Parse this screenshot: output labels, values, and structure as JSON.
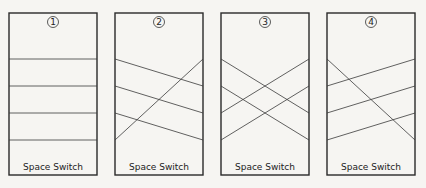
{
  "panels": [
    {
      "number": "1",
      "label": "Space Switch",
      "box": {
        "x": 9,
        "y": 13,
        "w": 88,
        "h": 162
      },
      "connections": [
        [
          0,
          0
        ],
        [
          1,
          1
        ],
        [
          2,
          2
        ],
        [
          3,
          3
        ]
      ]
    },
    {
      "number": "2",
      "label": "Space Switch",
      "box": {
        "x": 115,
        "y": 13,
        "w": 88,
        "h": 162
      },
      "connections": [
        [
          0,
          1
        ],
        [
          1,
          2
        ],
        [
          2,
          3
        ],
        [
          3,
          0
        ]
      ]
    },
    {
      "number": "3",
      "label": "Space Switch",
      "box": {
        "x": 221,
        "y": 13,
        "w": 88,
        "h": 162
      },
      "connections": [
        [
          0,
          2
        ],
        [
          1,
          3
        ],
        [
          2,
          0
        ],
        [
          3,
          1
        ]
      ]
    },
    {
      "number": "4",
      "label": "Space Switch",
      "box": {
        "x": 327,
        "y": 13,
        "w": 88,
        "h": 162
      },
      "connections": [
        [
          0,
          3
        ],
        [
          1,
          0
        ],
        [
          2,
          1
        ],
        [
          3,
          2
        ]
      ]
    }
  ],
  "port_y": [
    59,
    86,
    113,
    140
  ],
  "colors": {
    "stroke": "#2a2a2a",
    "line": "#3a3a3a",
    "background": "#f6f5f2"
  }
}
